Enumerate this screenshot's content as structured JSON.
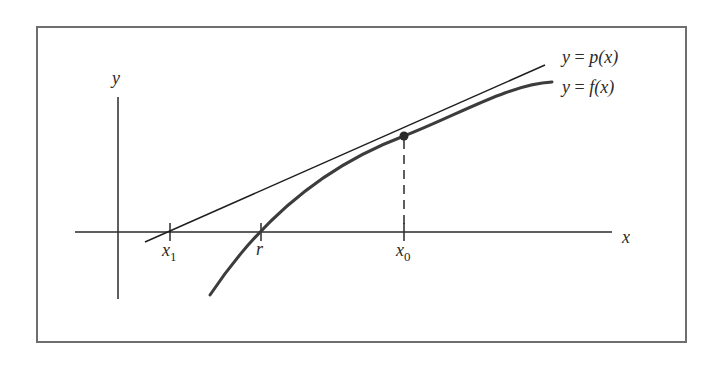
{
  "figure": {
    "axes": {
      "x_label": "x",
      "y_label": "y"
    },
    "curves": [
      {
        "id": "tangent",
        "label_lhs": "y",
        "label_eq": "=",
        "label_rhs": "p(x)",
        "style": "thin-line"
      },
      {
        "id": "function",
        "label_lhs": "y",
        "label_eq": "=",
        "label_rhs": "f(x)",
        "style": "thick-curve"
      }
    ],
    "ticks": [
      {
        "id": "x1",
        "base": "x",
        "sub": "1"
      },
      {
        "id": "r",
        "base": "r",
        "sub": ""
      },
      {
        "id": "x0",
        "base": "x",
        "sub": "0"
      }
    ],
    "point": {
      "at": "x0",
      "marker": "filled-circle"
    },
    "guide": {
      "style": "dashed",
      "from": "point",
      "to": "x0-tick"
    }
  },
  "colors": {
    "frame": "#6e6e6e",
    "axis": "#2a2a2a",
    "tangent": "#1e1e1e",
    "curve": "#3c3c3c",
    "point": "#2a2a2a",
    "background": "#ffffff"
  }
}
